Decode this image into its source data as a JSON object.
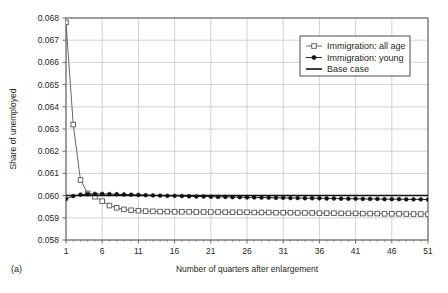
{
  "chart_data": {
    "type": "line",
    "title": "",
    "panel_label": "(a)",
    "xlabel": "Number of quarters after enlargement",
    "ylabel": "Share of unemployed",
    "xlim": [
      1,
      51
    ],
    "ylim": [
      0.058,
      0.068
    ],
    "xticks": [
      1,
      6,
      11,
      16,
      21,
      26,
      31,
      36,
      41,
      46,
      51
    ],
    "yticks": [
      0.058,
      0.059,
      0.06,
      0.061,
      0.062,
      0.063,
      0.064,
      0.065,
      0.066,
      0.067,
      0.068
    ],
    "ytick_labels": [
      "0.058",
      "0.059",
      "0.060",
      "0.061",
      "0.062",
      "0.063",
      "0.064",
      "0.065",
      "0.066",
      "0.067",
      "0.068"
    ],
    "xtick_labels": [
      "1",
      "6",
      "11",
      "16",
      "21",
      "26",
      "31",
      "36",
      "41",
      "46",
      "51"
    ],
    "grid": true,
    "legend_position": "top-right",
    "x": [
      1,
      2,
      3,
      4,
      5,
      6,
      7,
      8,
      9,
      10,
      11,
      12,
      13,
      14,
      15,
      16,
      17,
      18,
      19,
      20,
      21,
      22,
      23,
      24,
      25,
      26,
      27,
      28,
      29,
      30,
      31,
      32,
      33,
      34,
      35,
      36,
      37,
      38,
      39,
      40,
      41,
      42,
      43,
      44,
      45,
      46,
      47,
      48,
      49,
      50,
      51
    ],
    "series": [
      {
        "name": "Immigration: all age",
        "marker": "open-square",
        "color": "#555555",
        "values": [
          0.0678,
          0.0632,
          0.0607,
          0.0601,
          0.05995,
          0.05975,
          0.05955,
          0.05945,
          0.05938,
          0.05934,
          0.05932,
          0.0593,
          0.05929,
          0.05928,
          0.05928,
          0.05927,
          0.05927,
          0.05927,
          0.05926,
          0.05926,
          0.05926,
          0.05926,
          0.05925,
          0.05925,
          0.05925,
          0.05925,
          0.05924,
          0.05924,
          0.05924,
          0.05923,
          0.05923,
          0.05923,
          0.05922,
          0.05922,
          0.05922,
          0.05921,
          0.05921,
          0.05921,
          0.0592,
          0.0592,
          0.0592,
          0.05919,
          0.05919,
          0.05919,
          0.05918,
          0.05918,
          0.05918,
          0.05917,
          0.05917,
          0.05917,
          0.05916
        ]
      },
      {
        "name": "Immigration: young",
        "marker": "filled-dot",
        "color": "#111111",
        "values": [
          0.05985,
          0.05998,
          0.06004,
          0.06007,
          0.06008,
          0.06008,
          0.06007,
          0.06006,
          0.06005,
          0.06004,
          0.06003,
          0.06002,
          0.06001,
          0.06,
          0.05999,
          0.05999,
          0.05998,
          0.05997,
          0.05996,
          0.05996,
          0.05995,
          0.05994,
          0.05994,
          0.05993,
          0.05993,
          0.05992,
          0.05992,
          0.05991,
          0.05991,
          0.0599,
          0.0599,
          0.05989,
          0.05989,
          0.05988,
          0.05988,
          0.05988,
          0.05987,
          0.05987,
          0.05986,
          0.05986,
          0.05986,
          0.05985,
          0.05985,
          0.05985,
          0.05984,
          0.05984,
          0.05984,
          0.05983,
          0.05983,
          0.05983,
          0.05982
        ]
      },
      {
        "name": "Base case",
        "marker": "none",
        "color": "#111111",
        "values": [
          0.06,
          0.06,
          0.06,
          0.06,
          0.06,
          0.06,
          0.06,
          0.06,
          0.06,
          0.06,
          0.06,
          0.06,
          0.06,
          0.06,
          0.06,
          0.06,
          0.06,
          0.06,
          0.06,
          0.06,
          0.06,
          0.06,
          0.06,
          0.06,
          0.06,
          0.06,
          0.06,
          0.06,
          0.06,
          0.06,
          0.06,
          0.06,
          0.06,
          0.06,
          0.06,
          0.06,
          0.06,
          0.06,
          0.06,
          0.06,
          0.06,
          0.06,
          0.06,
          0.06,
          0.06,
          0.06,
          0.06,
          0.06,
          0.06,
          0.06,
          0.06
        ]
      }
    ],
    "legend": [
      {
        "label": "Immigration: all age",
        "marker": "open-square"
      },
      {
        "label": "Immigration: young",
        "marker": "filled-dot"
      },
      {
        "label": "Base case",
        "marker": "line"
      }
    ],
    "colors": {
      "grid": "#c8c8c8",
      "axis": "#6b6b6b",
      "plot_border": "#6b6b6b",
      "text": "#231f20",
      "all_age": "#555555",
      "young": "#111111",
      "base_case": "#111111",
      "background": "#ffffff"
    }
  }
}
